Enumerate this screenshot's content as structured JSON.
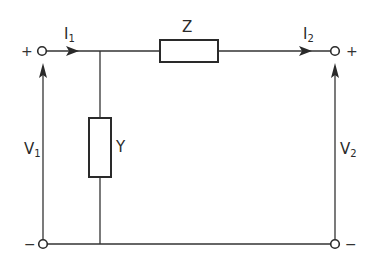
{
  "diagram": {
    "type": "two-port L-network circuit",
    "components": {
      "series_impedance": {
        "label": "Z"
      },
      "shunt_admittance": {
        "label": "Y"
      }
    },
    "currents": {
      "input": {
        "symbol": "I",
        "subscript": "1"
      },
      "output": {
        "symbol": "I",
        "subscript": "2"
      }
    },
    "voltages": {
      "input": {
        "symbol": "V",
        "subscript": "1"
      },
      "output": {
        "symbol": "V",
        "subscript": "2"
      }
    },
    "terminals": {
      "input_top": "+",
      "input_bottom": "−",
      "output_top": "+",
      "output_bottom": "−"
    }
  }
}
